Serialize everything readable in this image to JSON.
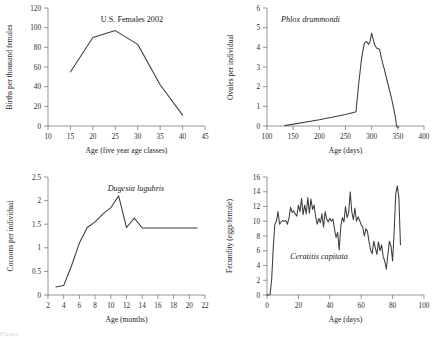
{
  "figure": {
    "background": "#ffffff",
    "line_color": "#3d3d3d",
    "axis_color": "#6a6a6a",
    "caption": "Figure"
  },
  "chart_data": [
    {
      "id": "us-females",
      "type": "line",
      "title": "U.S. Females 2002",
      "title_style": "upright",
      "xlabel": "Age (five year age classes)",
      "ylabel": "Births per thousand females",
      "xlim": [
        10,
        45
      ],
      "ylim": [
        0,
        120
      ],
      "xticks": [
        10,
        15,
        20,
        25,
        30,
        35,
        40,
        45
      ],
      "yticks": [
        0,
        20,
        40,
        60,
        80,
        100,
        120
      ],
      "grid": false,
      "legend": "none",
      "x": [
        15,
        20,
        25,
        30,
        35,
        40
      ],
      "values": [
        55,
        90,
        97,
        83,
        42,
        11
      ]
    },
    {
      "id": "phlox",
      "type": "line",
      "title": "Phlox drummondi",
      "title_style": "italic",
      "xlabel": "Age (days)",
      "ylabel": "Ovules per individual",
      "xlim": [
        100,
        400
      ],
      "ylim": [
        0,
        6
      ],
      "xticks": [
        100,
        150,
        200,
        250,
        300,
        350,
        400
      ],
      "yticks": [
        0,
        1,
        2,
        3,
        4,
        5,
        6
      ],
      "grid": false,
      "legend": "none",
      "x": [
        134,
        200,
        250,
        267,
        270,
        275,
        281,
        286,
        290,
        294,
        297,
        300,
        303,
        306,
        310,
        315,
        320,
        324,
        330,
        338,
        345,
        348,
        352
      ],
      "values": [
        0.02,
        0.32,
        0.58,
        0.7,
        0.72,
        2.1,
        3.5,
        4.2,
        4.3,
        4.15,
        4.3,
        4.72,
        4.4,
        4.1,
        3.95,
        3.9,
        3.3,
        2.9,
        2.25,
        1.4,
        0.5,
        -0.05,
        -0.05
      ]
    },
    {
      "id": "dugesia",
      "type": "line",
      "title": "Dugesia lugubris",
      "title_style": "italic",
      "xlabel": "Age (months)",
      "ylabel": "Cocoons per individual",
      "xlim": [
        2,
        22
      ],
      "ylim": [
        0.0,
        2.5
      ],
      "xticks": [
        2,
        4,
        6,
        8,
        10,
        12,
        14,
        16,
        18,
        20,
        22
      ],
      "yticks": [
        0.0,
        0.5,
        1.0,
        1.5,
        2.0,
        2.5
      ],
      "grid": false,
      "legend": "none",
      "x": [
        3,
        4,
        5,
        6,
        7,
        8,
        9,
        10,
        11,
        12,
        13,
        14,
        21
      ],
      "values": [
        0.17,
        0.2,
        0.62,
        1.1,
        1.43,
        1.55,
        1.72,
        1.85,
        2.1,
        1.43,
        1.63,
        1.42,
        1.42
      ]
    },
    {
      "id": "ceratitis",
      "type": "line",
      "title": "Ceratitis capitata",
      "title_style": "italic",
      "xlabel": "Age (days)",
      "ylabel": "Fecundity (eggs/female)",
      "xlim": [
        0,
        100
      ],
      "ylim": [
        0,
        16
      ],
      "xticks": [
        0,
        20,
        40,
        60,
        80,
        100
      ],
      "yticks": [
        0,
        2,
        4,
        6,
        8,
        10,
        12,
        14,
        16
      ],
      "grid": false,
      "legend": "none",
      "x": [
        0,
        1,
        2,
        3,
        4,
        5,
        6,
        7,
        8,
        9,
        10,
        11,
        12,
        13,
        14,
        15,
        16,
        17,
        18,
        19,
        20,
        21,
        22,
        23,
        24,
        25,
        26,
        27,
        28,
        29,
        30,
        31,
        32,
        33,
        34,
        35,
        36,
        37,
        38,
        39,
        40,
        41,
        42,
        43,
        44,
        45,
        46,
        47,
        48,
        49,
        50,
        51,
        52,
        53,
        54,
        55,
        56,
        57,
        58,
        59,
        60,
        61,
        62,
        63,
        64,
        65,
        66,
        67,
        68,
        69,
        70,
        71,
        72,
        73,
        74,
        75,
        76,
        77,
        78,
        79,
        80,
        81,
        82,
        83,
        84,
        85
      ],
      "values": [
        0,
        0,
        0.1,
        2.2,
        6.5,
        9.6,
        10.0,
        11.3,
        9.6,
        9.9,
        10.1,
        10.0,
        10.1,
        9.6,
        10.4,
        11.9,
        11.2,
        11.4,
        11.0,
        10.7,
        12.2,
        11.3,
        13.1,
        10.9,
        12.2,
        11.0,
        13.2,
        11.1,
        13.0,
        11.6,
        12.2,
        10.6,
        9.6,
        10.4,
        9.8,
        11.0,
        9.2,
        11.3,
        10.3,
        9.9,
        10.4,
        10.0,
        10.3,
        8.9,
        7.8,
        8.5,
        6.1,
        9.3,
        10.5,
        9.9,
        12.0,
        10.5,
        11.1,
        14.0,
        11.3,
        10.2,
        11.8,
        10.0,
        10.6,
        10.1,
        9.5,
        9.2,
        8.0,
        9.0,
        8.6,
        7.2,
        6.1,
        5.6,
        7.3,
        6.4,
        5.5,
        7.2,
        6.0,
        6.8,
        5.2,
        4.6,
        3.5,
        5.5,
        7.3,
        6.6,
        4.6,
        8.6,
        13.7,
        14.8,
        13.2,
        6.8
      ]
    }
  ]
}
